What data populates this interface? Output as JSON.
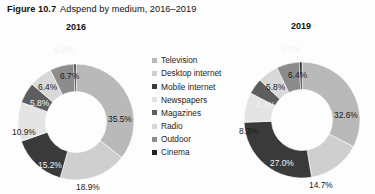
{
  "figure": {
    "number": "Figure 10.7",
    "caption": "Adspend by medium, 2016–2019"
  },
  "legend": {
    "items": [
      {
        "label": "Television",
        "color": "#b9b9b9"
      },
      {
        "label": "Desktop internet",
        "color": "#cfcfcf"
      },
      {
        "label": "Mobile internet",
        "color": "#3a3a3a"
      },
      {
        "label": "Newspapers",
        "color": "#e4e4e4"
      },
      {
        "label": "Magazines",
        "color": "#5e5e5e"
      },
      {
        "label": "Radio",
        "color": "#d8d8d8"
      },
      {
        "label": "Outdoor",
        "color": "#8c8c8c"
      },
      {
        "label": "Cinema",
        "color": "#232323"
      }
    ]
  },
  "panels": [
    {
      "year": "2016"
    },
    {
      "year": "2019"
    }
  ],
  "chart_data": [
    {
      "type": "pie",
      "title": "2016",
      "subtype": "donut",
      "categories": [
        "Television",
        "Desktop internet",
        "Mobile internet",
        "Newspapers",
        "Magazines",
        "Radio",
        "Outdoor",
        "Cinema"
      ],
      "values": [
        35.5,
        18.9,
        15.2,
        10.9,
        5.8,
        6.4,
        6.7,
        0.6
      ],
      "labels": [
        "35.5%",
        "18.9%",
        "15.2%",
        "10.9%",
        "5.8%",
        "6.4%",
        "6.7%",
        "0.6%"
      ],
      "colors": [
        "#b9b9b9",
        "#cfcfcf",
        "#3a3a3a",
        "#e4e4e4",
        "#5e5e5e",
        "#d8d8d8",
        "#8c8c8c",
        "#232323"
      ],
      "unit": "percent",
      "legend_position": "center",
      "grid": false
    },
    {
      "type": "pie",
      "title": "2019",
      "subtype": "donut",
      "categories": [
        "Television",
        "Desktop internet",
        "Mobile internet",
        "Newspapers",
        "Magazines",
        "Radio",
        "Outdoor",
        "Cinema"
      ],
      "values": [
        32.6,
        14.7,
        27.0,
        8.3,
        4.4,
        5.8,
        6.4,
        0.7
      ],
      "labels": [
        "32.6%",
        "14.7%",
        "27.0%",
        "8.3%",
        "4.4%",
        "5.8%",
        "6.4%",
        "0.7%"
      ],
      "colors": [
        "#b9b9b9",
        "#cfcfcf",
        "#3a3a3a",
        "#e4e4e4",
        "#5e5e5e",
        "#d8d8d8",
        "#8c8c8c",
        "#232323"
      ],
      "unit": "percent",
      "legend_position": "center",
      "grid": false
    }
  ]
}
